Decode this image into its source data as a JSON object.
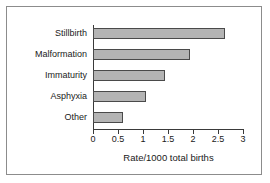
{
  "chart_data": {
    "type": "bar",
    "orientation": "horizontal",
    "title": "",
    "xlabel": "Rate/1000 total births",
    "ylabel": "",
    "xlim": [
      0,
      3
    ],
    "xticks": [
      "0",
      "0.5",
      "1",
      "1.5",
      "2",
      "2.5",
      "3"
    ],
    "xtick_values": [
      0,
      0.5,
      1,
      1.5,
      2,
      2.5,
      3
    ],
    "grid": false,
    "legend": null,
    "categories": [
      "Stillbirth",
      "Malformation",
      "Immaturity",
      "Asphyxia",
      "Other"
    ],
    "values": [
      2.63,
      1.93,
      1.43,
      1.05,
      0.6
    ],
    "bars": [
      {
        "label": "Stillbirth",
        "value": 2.63
      },
      {
        "label": "Malformation",
        "value": 1.93
      },
      {
        "label": "Immaturity",
        "value": 1.43
      },
      {
        "label": "Asphyxia",
        "value": 1.05
      },
      {
        "label": "Other",
        "value": 0.6
      }
    ],
    "colors": {
      "bar_fill": "#b4b4b4",
      "bar_edge": "#4a4a4a",
      "axis": "#3a3a3a",
      "frame": "#8c8c8c",
      "text": "#1a1a1a",
      "background": "#ffffff"
    }
  }
}
